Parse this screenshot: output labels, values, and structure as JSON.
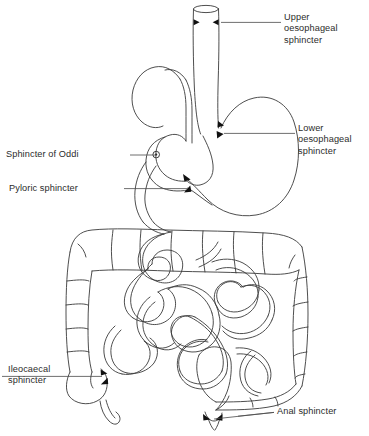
{
  "figure": {
    "kind": "anatomical-line-diagram",
    "background_color": "#ffffff",
    "ink_color": "#3a3a3a",
    "marker_color": "#111111"
  },
  "labels": {
    "upper_oesophageal": "Upper\noesophageal\nsphincter",
    "lower_oesophageal": "Lower\noesophageal\nsphincter",
    "sphincter_of_oddi": "Sphincter of Oddi",
    "pyloric": "Pyloric sphincter",
    "ileocaecal": "Ileocaecal\nsphincter",
    "anal": "Anal sphincter"
  },
  "structures": {
    "oesophagus": "oesophagus",
    "stomach": "stomach",
    "duodenum": "duodenum",
    "small_intestine": "small-intestine-coils",
    "ascending_colon": "ascending-colon",
    "transverse_colon": "transverse-colon",
    "descending_colon": "descending-colon",
    "caecum": "caecum",
    "appendix": "appendix",
    "rectum": "rectum"
  },
  "markers": {
    "upper_oesophageal": "paired-arrowheads",
    "lower_oesophageal": "paired-arrowheads",
    "sphincter_of_oddi": "small-circle-ampulla",
    "pyloric": "paired-arrowheads",
    "ileocaecal": "paired-arrowheads",
    "anal": "paired-arrowheads"
  }
}
